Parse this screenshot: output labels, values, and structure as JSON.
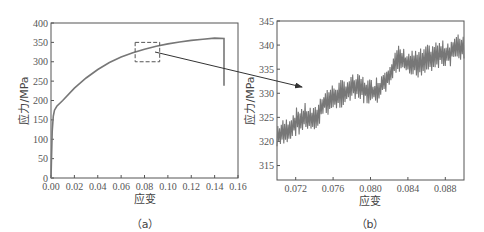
{
  "chart_data": [
    {
      "type": "line",
      "panel": "(a)",
      "title": "",
      "xlabel": "应变",
      "ylabel": "应力/MPa",
      "xlim": [
        0,
        0.16
      ],
      "ylim": [
        0,
        400
      ],
      "xticks": [
        "0.00",
        "0.02",
        "0.04",
        "0.06",
        "0.08",
        "0.10",
        "0.12",
        "0.14",
        "0.16"
      ],
      "yticks": [
        "0",
        "50",
        "100",
        "150",
        "200",
        "250",
        "300",
        "350",
        "400"
      ],
      "grid": false,
      "series": [
        {
          "name": "stress-strain",
          "x": [
            0,
            0.001,
            0.002,
            0.003,
            0.005,
            0.01,
            0.02,
            0.03,
            0.04,
            0.05,
            0.06,
            0.07,
            0.08,
            0.09,
            0.1,
            0.11,
            0.12,
            0.13,
            0.14,
            0.148,
            0.148
          ],
          "y": [
            0,
            120,
            160,
            175,
            185,
            200,
            232,
            258,
            280,
            298,
            312,
            323,
            332,
            340,
            346,
            351,
            355,
            358,
            361,
            360,
            238
          ]
        }
      ],
      "annotations": [
        {
          "type": "dashed-rect",
          "x": [
            0.072,
            0.093
          ],
          "y": [
            300,
            350
          ]
        }
      ]
    },
    {
      "type": "line",
      "panel": "(b)",
      "title": "",
      "xlabel": "应变",
      "ylabel": "应力/MPa",
      "xlim": [
        0.07,
        0.09
      ],
      "ylim": [
        312,
        345
      ],
      "xticks": [
        "0.072",
        "0.076",
        "0.080",
        "0.084",
        "0.088"
      ],
      "yticks": [
        "315",
        "320",
        "325",
        "330",
        "335",
        "340",
        "345"
      ],
      "grid": false,
      "series": [
        {
          "name": "zoomed stress-strain",
          "x": [
            0.07,
            0.071,
            0.072,
            0.073,
            0.074,
            0.075,
            0.076,
            0.077,
            0.078,
            0.079,
            0.08,
            0.081,
            0.082,
            0.083,
            0.084,
            0.085,
            0.086,
            0.087,
            0.088,
            0.089,
            0.09
          ],
          "y": [
            321,
            322,
            324,
            325,
            324,
            328,
            329,
            330,
            331,
            331,
            330,
            331,
            334,
            337,
            336,
            336,
            337,
            338,
            338,
            339,
            340
          ]
        }
      ]
    }
  ],
  "labels": {
    "panel_a": "（a）",
    "panel_b": "（b）",
    "xlabel": "应变",
    "ylabel": "应力/MPa"
  }
}
